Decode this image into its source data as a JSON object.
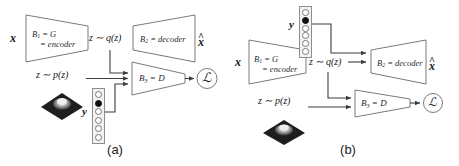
{
  "figure": {
    "type": "diagram",
    "background_color": "#ffffff",
    "stroke_color": "#4a4a4a",
    "text_color": "#1a1a1a"
  },
  "panels": [
    {
      "id": "a",
      "caption": "(a)",
      "nodes": {
        "input_x": "x",
        "output_xhat": "x",
        "output_xhat_hat": "^",
        "encoder_line1": "B₁ = G",
        "encoder_line2": "= encoder",
        "decoder_label": "B₂ = decoder",
        "discriminator_label": "B₃ = D",
        "latent_posterior": "z ∼ q(z)",
        "latent_prior": "z ∼ p(z)",
        "condition_y": "y",
        "loss_symbol": "ℒ"
      },
      "onehot": {
        "cells": 6,
        "active_index": 1,
        "position": "bottom"
      },
      "surface_plot": {
        "name": "prior-density-surface",
        "colormap": "dark"
      }
    },
    {
      "id": "b",
      "caption": "(b)",
      "nodes": {
        "input_x": "x",
        "output_xhat": "x",
        "output_xhat_hat": "^",
        "encoder_line1": "B₁ = G",
        "encoder_line2": "= encoder",
        "decoder_label": "B₂ = decoder",
        "discriminator_label": "B₃ = D",
        "latent_posterior": "z ∼ q(z)",
        "latent_prior": "z ∼ p(z)",
        "condition_y": "y",
        "loss_symbol": "ℒ"
      },
      "onehot": {
        "cells": 6,
        "active_index": 1,
        "position": "top"
      },
      "surface_plot": {
        "name": "prior-density-surface",
        "colormap": "dark"
      }
    }
  ]
}
